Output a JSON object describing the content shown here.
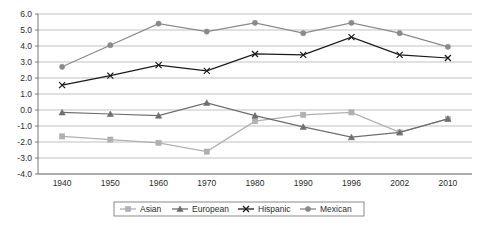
{
  "chart_data": {
    "type": "line",
    "title": "",
    "subtitle": "",
    "xlabel": "",
    "ylabel": "",
    "x": [
      "1940",
      "1950",
      "1960",
      "1970",
      "1980",
      "1990",
      "1996",
      "2002",
      "2010"
    ],
    "categories": [
      "1940",
      "1950",
      "1960",
      "1970",
      "1980",
      "1990",
      "1996",
      "2002",
      "2010"
    ],
    "ylim": [
      -4.0,
      6.0
    ],
    "ytick_labels": [
      "6.0",
      "5.0",
      "4.0",
      "3.0",
      "2.0",
      "1.0",
      "0.0",
      "-1.0",
      "-2.0",
      "-3.0",
      "-4.0"
    ],
    "ytick_values": [
      6.0,
      5.0,
      4.0,
      3.0,
      2.0,
      1.0,
      0.0,
      -1.0,
      -2.0,
      -3.0,
      -4.0
    ],
    "grid": true,
    "grid_axis": "y",
    "legend_position": "bottom",
    "series": [
      {
        "name": "Asian",
        "marker": "square",
        "color": "#b0b0b0",
        "values": [
          -1.65,
          -1.85,
          -2.05,
          -2.6,
          -0.7,
          -0.3,
          -0.15,
          -1.4,
          -0.55
        ]
      },
      {
        "name": "European",
        "marker": "triangle",
        "color": "#6e6e6e",
        "values": [
          -0.15,
          -0.25,
          -0.35,
          0.45,
          -0.35,
          -1.05,
          -1.7,
          -1.4,
          -0.55
        ]
      },
      {
        "name": "Hispanic",
        "marker": "x",
        "color": "#1a1a1a",
        "values": [
          1.55,
          2.15,
          2.8,
          2.45,
          3.5,
          3.45,
          4.55,
          3.45,
          3.25
        ]
      },
      {
        "name": "Mexican",
        "marker": "circle",
        "color": "#8a8a8a",
        "values": [
          2.7,
          4.05,
          5.4,
          4.9,
          5.45,
          4.8,
          5.45,
          4.8,
          3.95
        ]
      }
    ]
  },
  "axis": {
    "grid_color": "#a8a8a8",
    "axis_color": "#6b6b6b",
    "text_color": "#2b2b2b",
    "background": "#ffffff"
  },
  "legend": {
    "border_color": "#6b6b6b",
    "entries": [
      {
        "label": "Asian"
      },
      {
        "label": "European"
      },
      {
        "label": "Hispanic"
      },
      {
        "label": "Mexican"
      }
    ]
  }
}
